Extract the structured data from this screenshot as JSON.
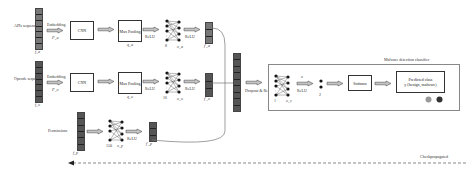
{
  "diagram": {
    "branches": [
      {
        "name": "apis",
        "input_label": "APIs sequence",
        "input_vector": "f_a",
        "embed_label": "Embedding",
        "embed_param": "P_a",
        "cnn": "CNN",
        "pool": "Max Pooling",
        "pool_param": "q_a",
        "relu1": "ReLU",
        "dense_n": "8",
        "dense_param": "o_a",
        "relu2": "ReLU",
        "out_vector": "f'_a"
      },
      {
        "name": "opcodes",
        "input_label": "Opcode sequence",
        "input_vector": "f_o",
        "embed_label": "Embedding",
        "embed_param": "P_o",
        "cnn": "CNN",
        "pool": "Max Pooling",
        "pool_param": "q_o",
        "relu1": "ReLU",
        "dense_n": "16",
        "dense_param": "o_o",
        "relu2": "ReLU",
        "out_vector": "f'_o"
      },
      {
        "name": "permissions",
        "input_label": "Permissions",
        "input_vector": "f_p",
        "dense_n": "150",
        "dense_param": "o_p",
        "relu2": "ReLU",
        "out_vector": "f'_p"
      }
    ],
    "merge": {
      "label": "Dropout & ReLU"
    },
    "classifier": {
      "title": "Malware detection classifier",
      "dense_n": "1",
      "dense_param": "o_c",
      "z_label": "z",
      "relu": "ReLU",
      "out_n": "2",
      "softmax": "Softmax",
      "predicted_line1": "Predicted class",
      "predicted_line2": "y (benign, malware)",
      "icons": [
        "android-benign-icon",
        "android-malware-icon"
      ]
    },
    "backprop_label": "Checkpropagated"
  },
  "colors": {
    "arrow_fill": "#bdbdbd",
    "arrow_stroke": "#555555",
    "vector_fill": "#666666",
    "line": "#333333"
  }
}
